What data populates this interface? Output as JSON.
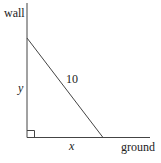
{
  "diagram": {
    "type": "geometry",
    "labels": {
      "wall": "wall",
      "ground": "ground",
      "vertical_side": "y",
      "horizontal_side": "x",
      "hypotenuse": "10"
    },
    "colors": {
      "line": "#444444",
      "text": "#222222",
      "background": "#ffffff"
    }
  }
}
